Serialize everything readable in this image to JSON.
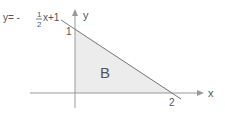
{
  "diagram": {
    "equation": {
      "prefix": "y= -",
      "num": "1",
      "den": "2",
      "suffix": "x+1"
    },
    "axes": {
      "x_label": "x",
      "y_label": "y"
    },
    "intercepts": {
      "y_intercept": "1",
      "x_intercept": "2"
    },
    "region_label": "B",
    "colors": {
      "axis": "#888888",
      "line": "#777777",
      "fill": "#ececec",
      "text": "#555555"
    }
  }
}
